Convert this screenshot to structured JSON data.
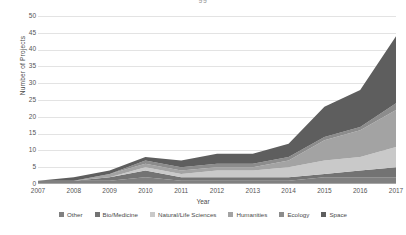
{
  "title_sliver": "gg",
  "axis": {
    "xlabel": "Year",
    "ylabel": "Number of Projects"
  },
  "yticks": [
    "0",
    "5",
    "10",
    "15",
    "20",
    "25",
    "30",
    "35",
    "40",
    "45",
    "50"
  ],
  "xticks": [
    "2007",
    "2008",
    "2009",
    "2010",
    "2011",
    "2012",
    "2013",
    "2014",
    "2015",
    "2016",
    "2017"
  ],
  "legend": {
    "items": [
      {
        "label": "Other",
        "color": "#808080"
      },
      {
        "label": "Bio/Medicine",
        "color": "#737373"
      },
      {
        "label": "Natural/Life Sciences",
        "color": "#c9c9c9"
      },
      {
        "label": "Humanities",
        "color": "#a3a3a3"
      },
      {
        "label": "Ecology",
        "color": "#8c8c8c"
      },
      {
        "label": "Space",
        "color": "#5e5e5e"
      }
    ]
  },
  "chart_data": {
    "type": "area",
    "stacked": true,
    "title": "",
    "xlabel": "Year",
    "ylabel": "Number of Projects",
    "x": [
      2007,
      2008,
      2009,
      2010,
      2011,
      2012,
      2013,
      2014,
      2015,
      2016,
      2017
    ],
    "ylim": [
      0,
      50
    ],
    "ytick_step": 5,
    "grid": true,
    "legend_position": "bottom",
    "series": [
      {
        "name": "Other",
        "color": "#808080",
        "values": [
          1,
          1,
          1,
          2,
          1,
          1,
          1,
          1,
          2,
          2,
          2
        ]
      },
      {
        "name": "Bio/Medicine",
        "color": "#737373",
        "values": [
          0,
          0,
          1,
          2,
          1,
          1,
          1,
          1,
          1,
          2,
          3
        ]
      },
      {
        "name": "Natural/Life Sciences",
        "color": "#c9c9c9",
        "values": [
          0,
          0,
          0,
          1,
          1,
          2,
          2,
          3,
          4,
          4,
          6
        ]
      },
      {
        "name": "Humanities",
        "color": "#a3a3a3",
        "values": [
          0,
          0,
          1,
          1,
          1,
          1,
          1,
          2,
          6,
          8,
          11
        ]
      },
      {
        "name": "Ecology",
        "color": "#8c8c8c",
        "values": [
          0,
          0,
          0,
          1,
          1,
          1,
          1,
          1,
          1,
          1,
          2
        ]
      },
      {
        "name": "Space",
        "color": "#5e5e5e",
        "values": [
          0,
          1,
          1,
          1,
          2,
          3,
          3,
          4,
          9,
          11,
          20
        ]
      }
    ],
    "totals": [
      1,
      2,
      4,
      8,
      7,
      9,
      9,
      12,
      23,
      28,
      44
    ]
  }
}
